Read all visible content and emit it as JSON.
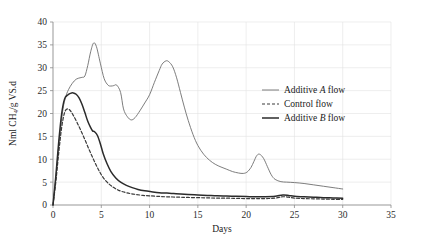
{
  "chart_data": {
    "type": "line",
    "title": "",
    "xlabel": "Days",
    "ylabel": "Nml CH4/g VS.d",
    "ylabel_display": "Nml CH₄/g VS.d",
    "xlim": [
      0,
      35
    ],
    "ylim": [
      0,
      40
    ],
    "xticks": [
      0,
      5,
      10,
      15,
      20,
      25,
      30,
      35
    ],
    "yticks": [
      0,
      5,
      10,
      15,
      20,
      25,
      30,
      35,
      40
    ],
    "xtick_labels": [
      "0",
      "5",
      "10",
      "15",
      "20",
      "25",
      "30",
      "35"
    ],
    "ytick_labels": [
      "0",
      "5",
      "10",
      "15",
      "20",
      "25",
      "30",
      "35",
      "40"
    ],
    "grid": true,
    "grid_axes": "both",
    "legend_position": "center-right",
    "series": [
      {
        "name": "Additive A flow",
        "name_parts": {
          "prefix": "Additive ",
          "italic": "A",
          "suffix": " flow"
        },
        "style": "solid",
        "color": "#6e6e6e",
        "width": 0.9,
        "x": [
          0,
          0.3,
          0.6,
          1.0,
          1.3,
          1.6,
          2.0,
          2.4,
          2.8,
          3.0,
          3.3,
          3.6,
          3.9,
          4.2,
          4.5,
          4.9,
          5.3,
          5.7,
          6.0,
          6.3,
          6.6,
          7.0,
          7.3,
          7.7,
          8.1,
          8.5,
          9.0,
          9.5,
          10.0,
          10.5,
          11.0,
          11.3,
          11.7,
          12.0,
          12.4,
          12.8,
          13.2,
          13.6,
          14.0,
          14.5,
          15.0,
          15.6,
          16.2,
          16.8,
          17.4,
          18.0,
          18.6,
          19.2,
          19.7,
          20.1,
          20.5,
          20.8,
          21.1,
          21.4,
          21.8,
          22.2,
          22.6,
          23.0,
          23.6,
          24.2,
          25.0,
          26.0,
          27.0,
          28.0,
          29.0,
          30.0
        ],
        "y": [
          0,
          6.0,
          13.0,
          20.5,
          23.5,
          25.2,
          26.6,
          27.5,
          27.8,
          27.9,
          28.2,
          30.5,
          33.5,
          35.4,
          34.6,
          31.0,
          27.6,
          26.2,
          26.0,
          26.1,
          26.2,
          24.6,
          21.0,
          19.3,
          18.6,
          19.1,
          20.6,
          22.3,
          24.1,
          26.8,
          29.4,
          30.8,
          31.5,
          31.3,
          30.2,
          27.8,
          24.6,
          21.4,
          18.5,
          15.4,
          13.0,
          11.1,
          9.8,
          8.9,
          8.3,
          7.8,
          7.3,
          7.0,
          6.9,
          7.2,
          8.2,
          9.5,
          10.8,
          11.1,
          10.2,
          8.4,
          6.6,
          5.6,
          5.1,
          5.0,
          4.9,
          4.7,
          4.4,
          4.1,
          3.8,
          3.5
        ]
      },
      {
        "name": "Control flow",
        "name_parts": {
          "prefix": "Control flow",
          "italic": "",
          "suffix": ""
        },
        "style": "dashed",
        "color": "#3a3a3a",
        "width": 1.2,
        "dash": "3,2",
        "x": [
          0,
          0.3,
          0.6,
          0.9,
          1.2,
          1.5,
          1.8,
          2.1,
          2.5,
          2.9,
          3.3,
          3.7,
          4.1,
          4.5,
          4.9,
          5.3,
          5.8,
          6.3,
          6.8,
          7.4,
          8.0,
          8.6,
          9.3,
          10.0,
          10.8,
          11.6,
          12.4,
          13.2,
          14.0,
          15.0,
          16.0,
          17.0,
          18.0,
          19.0,
          20.0,
          21.0,
          22.0,
          23.0,
          23.8,
          24.4,
          25.0,
          26.0,
          27.0,
          28.0,
          29.0,
          30.0
        ],
        "y": [
          0,
          5.2,
          11.5,
          17.0,
          20.2,
          21.0,
          20.6,
          19.6,
          18.0,
          16.2,
          14.3,
          12.3,
          10.4,
          8.6,
          7.0,
          5.7,
          4.6,
          3.8,
          3.2,
          2.8,
          2.5,
          2.3,
          2.1,
          2.0,
          1.9,
          1.8,
          1.75,
          1.7,
          1.65,
          1.6,
          1.55,
          1.5,
          1.5,
          1.45,
          1.4,
          1.4,
          1.4,
          1.5,
          1.8,
          1.7,
          1.5,
          1.4,
          1.35,
          1.3,
          1.25,
          1.2
        ]
      },
      {
        "name": "Additive B flow",
        "name_parts": {
          "prefix": "Additive ",
          "italic": "B",
          "suffix": " flow"
        },
        "style": "solid",
        "color": "#2b2b2b",
        "width": 1.5,
        "x": [
          0,
          0.3,
          0.6,
          0.9,
          1.2,
          1.5,
          1.8,
          2.1,
          2.4,
          2.7,
          3.0,
          3.3,
          3.6,
          3.9,
          4.1,
          4.3,
          4.6,
          4.9,
          5.2,
          5.6,
          6.0,
          6.5,
          7.0,
          7.6,
          8.2,
          8.8,
          9.5,
          10.2,
          11.0,
          11.8,
          12.5,
          13.2,
          14.0,
          15.0,
          16.0,
          17.0,
          18.0,
          19.0,
          20.0,
          21.0,
          22.0,
          23.0,
          23.8,
          24.4,
          25.0,
          26.0,
          27.0,
          28.0,
          29.0,
          30.0
        ],
        "y": [
          0,
          6.5,
          14.0,
          20.0,
          23.2,
          24.0,
          24.4,
          24.5,
          24.2,
          23.4,
          22.0,
          20.2,
          18.3,
          16.9,
          16.2,
          16.0,
          15.2,
          13.4,
          11.2,
          9.0,
          7.3,
          5.9,
          5.0,
          4.3,
          3.8,
          3.4,
          3.1,
          2.9,
          2.7,
          2.6,
          2.5,
          2.4,
          2.3,
          2.2,
          2.1,
          2.0,
          1.95,
          1.9,
          1.85,
          1.8,
          1.8,
          1.9,
          2.2,
          2.1,
          1.9,
          1.8,
          1.7,
          1.6,
          1.55,
          1.5
        ]
      }
    ]
  },
  "legend": {
    "items": [
      {
        "label": "Additive A flow",
        "prefix": "Additive ",
        "italic": "A",
        "suffix": " flow",
        "style": "solid",
        "color": "#6e6e6e",
        "width": 0.9
      },
      {
        "label": "Control flow",
        "prefix": "Control flow",
        "italic": "",
        "suffix": "",
        "style": "dashed",
        "color": "#3a3a3a",
        "width": 1.2
      },
      {
        "label": "Additive B flow",
        "prefix": "Additive ",
        "italic": "B",
        "suffix": " flow",
        "style": "solid",
        "color": "#2b2b2b",
        "width": 1.5
      }
    ]
  },
  "colors": {
    "background": "#ffffff",
    "grid": "#e2e2e2",
    "axis": "#8a8a8a",
    "text": "#1a1a1a"
  }
}
